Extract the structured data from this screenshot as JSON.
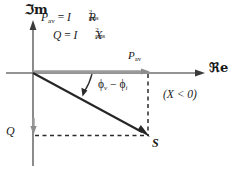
{
  "figure": {
    "type": "phasor-diagram",
    "axes": {
      "imaginary_label": "ℑm",
      "real_label": "ℜe",
      "origin": [
        33,
        73
      ]
    },
    "equations": {
      "line1": {
        "lhs": "P",
        "lhs_sub": "av",
        "eq": "=",
        "var": "I",
        "exp": "2",
        "var_sub": "rms",
        "rhs": "R"
      },
      "line2": {
        "lhs": "Q",
        "eq": "=",
        "var": "I",
        "exp": "2",
        "var_sub": "rms",
        "rhs": "X"
      }
    },
    "labels": {
      "p_av": "P",
      "p_av_sub": "av",
      "q": "Q",
      "s": "S",
      "phase_v": "ϕ",
      "phase_v_sub": "v",
      "phase_minus": "−",
      "phase_i": "ϕ",
      "phase_i_sub": "i",
      "condition": "(X < 0)"
    },
    "vector": {
      "name": "S",
      "from": [
        33,
        73
      ],
      "to": [
        148,
        138
      ],
      "real_component_x": 148,
      "imag_component_y": 138
    },
    "colors": {
      "ink": "#1a1a1a",
      "axis": "#6f6f6f",
      "gray_segment": "#9a9a9a",
      "dashed": "#2b2b2b",
      "background": "#ffffff"
    }
  }
}
